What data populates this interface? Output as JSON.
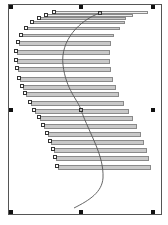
{
  "canvas": {
    "width": 168,
    "height": 225,
    "frame": {
      "x": 8,
      "y": 4,
      "w": 154,
      "h": 211,
      "border_color": "#555555"
    },
    "selection_handles": [
      {
        "x": 9,
        "y": 5
      },
      {
        "x": 79,
        "y": 5
      },
      {
        "x": 151,
        "y": 5
      },
      {
        "x": 9,
        "y": 108
      },
      {
        "x": 151,
        "y": 108
      },
      {
        "x": 9,
        "y": 210
      },
      {
        "x": 79,
        "y": 210
      },
      {
        "x": 151,
        "y": 210
      }
    ],
    "bar_fill": "#c9c9c9",
    "bar_border": "#8a8a8a",
    "bars": [
      {
        "x": 53,
        "y": 11,
        "right": 148
      },
      {
        "x": 45,
        "y": 14,
        "right": 133
      },
      {
        "x": 38,
        "y": 17,
        "right": 126
      },
      {
        "x": 31,
        "y": 21,
        "right": 125
      },
      {
        "x": 25,
        "y": 27,
        "right": 120
      },
      {
        "x": 20,
        "y": 34,
        "right": 114
      },
      {
        "x": 17,
        "y": 41,
        "right": 111
      },
      {
        "x": 15,
        "y": 50,
        "right": 110
      },
      {
        "x": 15,
        "y": 59,
        "right": 110
      },
      {
        "x": 16,
        "y": 67,
        "right": 111
      },
      {
        "x": 18,
        "y": 77,
        "right": 113
      },
      {
        "x": 21,
        "y": 85,
        "right": 116
      },
      {
        "x": 24,
        "y": 92,
        "right": 119
      },
      {
        "x": 29,
        "y": 101,
        "right": 124
      },
      {
        "x": 33,
        "y": 109,
        "right": 129
      },
      {
        "x": 38,
        "y": 116,
        "right": 133
      },
      {
        "x": 42,
        "y": 124,
        "right": 137
      },
      {
        "x": 46,
        "y": 132,
        "right": 141
      },
      {
        "x": 49,
        "y": 140,
        "right": 144
      },
      {
        "x": 52,
        "y": 148,
        "right": 147
      },
      {
        "x": 54,
        "y": 156,
        "right": 149
      },
      {
        "x": 56,
        "y": 165,
        "right": 151
      }
    ],
    "curve": {
      "color": "#555555",
      "path": "M100 13 C 80 20, 60 40, 63 65 C 66 90, 78 100, 81 110 C 90 135, 104 155, 103 178 C 102 192, 90 200, 74 208",
      "start_control": {
        "x": 98,
        "y": 11
      },
      "mid_control": {
        "x": 79,
        "y": 108
      }
    }
  }
}
